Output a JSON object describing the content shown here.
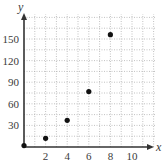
{
  "chart_data": {
    "type": "scatter",
    "title": "",
    "xlabel": "x",
    "ylabel": "y",
    "xlim": [
      0,
      12
    ],
    "ylim": [
      0,
      180
    ],
    "x_ticks": [
      2,
      4,
      6,
      8,
      10
    ],
    "y_ticks": [
      30,
      60,
      90,
      120,
      150
    ],
    "x_tick_labels": [
      "2",
      "4",
      "6",
      "8",
      "10"
    ],
    "y_tick_labels": [
      "30",
      "60",
      "90",
      "120",
      "150"
    ],
    "grid": true,
    "grid_x_step": 1,
    "grid_y_step": 15,
    "legend": null,
    "points": [
      {
        "x": 0,
        "y": 2
      },
      {
        "x": 2,
        "y": 12
      },
      {
        "x": 4,
        "y": 37
      },
      {
        "x": 6,
        "y": 77
      },
      {
        "x": 8,
        "y": 156
      }
    ]
  },
  "colors": {
    "axis": "#333333",
    "grid": "#a8a8a8",
    "point": "#111111",
    "text": "#3a3a3a"
  }
}
